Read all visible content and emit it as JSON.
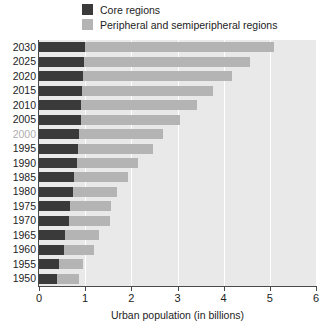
{
  "chart_data": {
    "type": "bar",
    "orientation": "horizontal",
    "stacked": true,
    "title": "",
    "xlabel": "Urban population (in billions)",
    "ylabel": "",
    "xlim": [
      0,
      6
    ],
    "xticks": [
      0,
      1,
      2,
      3,
      4,
      5,
      6
    ],
    "xtick_labels": [
      "0",
      "1",
      "2",
      "3",
      "4",
      "5",
      "6"
    ],
    "grid": true,
    "grid_axis": "x",
    "legend_position": "top",
    "categories": [
      "2030",
      "2025",
      "2020",
      "2015",
      "2010",
      "2005",
      "2000",
      "1995",
      "1990",
      "1985",
      "1980",
      "1975",
      "1970",
      "1965",
      "1960",
      "1955",
      "1950"
    ],
    "dim_categories": [
      "2000"
    ],
    "series": [
      {
        "name": "Core regions",
        "color": "#3a3a3a",
        "values": [
          1.0,
          0.98,
          0.96,
          0.94,
          0.92,
          0.9,
          0.87,
          0.85,
          0.82,
          0.76,
          0.73,
          0.67,
          0.65,
          0.56,
          0.54,
          0.44,
          0.4
        ]
      },
      {
        "name": "Peripheral and semiperipheral regions",
        "color": "#b4b4b4",
        "values": [
          4.08,
          3.59,
          3.22,
          2.83,
          2.5,
          2.15,
          1.81,
          1.62,
          1.32,
          1.17,
          0.96,
          0.89,
          0.89,
          0.74,
          0.65,
          0.51,
          0.47
        ]
      }
    ],
    "totals": [
      5.08,
      4.57,
      4.18,
      3.77,
      3.42,
      3.05,
      2.68,
      2.47,
      2.14,
      1.93,
      1.69,
      1.56,
      1.54,
      1.3,
      1.19,
      0.95,
      0.87
    ]
  },
  "legend": {
    "items": [
      {
        "label": "Core regions",
        "swatch": "core-swatch-icon"
      },
      {
        "label": "Peripheral and semiperipheral regions",
        "swatch": "peripheral-swatch-icon"
      }
    ]
  },
  "colors": {
    "core": "#3a3a3a",
    "peripheral": "#b4b4b4",
    "plot_background": "#e9e9e9",
    "gridline": "#ffffff",
    "axis": "#4a4a4a",
    "text": "#1d1d1d",
    "dim_text": "#b0b0b0"
  }
}
